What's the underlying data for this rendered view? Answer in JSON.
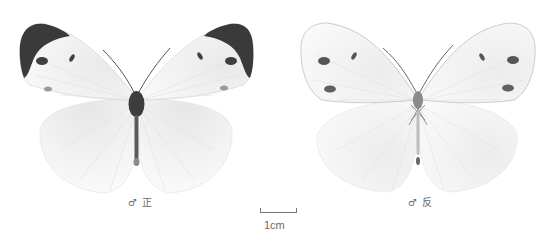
{
  "figure": {
    "specimens": [
      {
        "id": "dorsal",
        "caption": "♂ 正",
        "sex_symbol": "♂",
        "view": "正"
      },
      {
        "id": "ventral",
        "caption": "♂ 反",
        "sex_symbol": "♂",
        "view": "反"
      }
    ],
    "scale_bar": {
      "label": "1cm"
    },
    "colors": {
      "background": "#ffffff",
      "wing": "#f7f7f7",
      "wing_apex": "#3a3a3a",
      "spot": "#4a4a4a",
      "vein": "#d8d8d8",
      "body": "#3d3d3d",
      "caption": "#6a6a6a"
    }
  }
}
